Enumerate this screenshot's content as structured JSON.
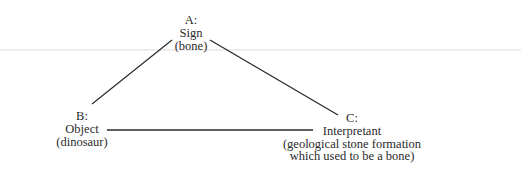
{
  "diagram": {
    "type": "semiotic-triangle",
    "nodes": [
      {
        "id": "A",
        "label": "A:",
        "role": "Sign",
        "example_lines": [
          "(bone)"
        ]
      },
      {
        "id": "B",
        "label": "B:",
        "role": "Object",
        "example_lines": [
          "(dinosaur)"
        ]
      },
      {
        "id": "C",
        "label": "C:",
        "role": "Interpretant",
        "example_lines": [
          "(geological stone formation",
          "which used to be a bone)"
        ]
      }
    ],
    "edges": [
      {
        "from": "A",
        "to": "B"
      },
      {
        "from": "A",
        "to": "C"
      },
      {
        "from": "B",
        "to": "C"
      }
    ],
    "colors": {
      "line": "#2a2a2a",
      "text": "#2a2a2a",
      "background": "#ffffff",
      "page_rule": "#ececec"
    }
  }
}
